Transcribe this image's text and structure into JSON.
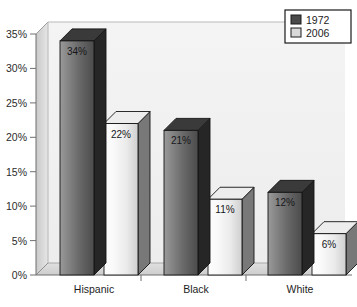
{
  "chart_data": {
    "type": "bar",
    "title": "",
    "subtitle": "",
    "xlabel": "",
    "ylabel": "",
    "categories": [
      "Hispanic",
      "Black",
      "White"
    ],
    "series": [
      {
        "name": "1972",
        "values": [
          34,
          21,
          12
        ],
        "color": "#4a4a4a"
      },
      {
        "name": "2006",
        "values": [
          22,
          11,
          6
        ],
        "color": "#e2e2e2"
      }
    ],
    "value_labels": [
      [
        "34%",
        "22%"
      ],
      [
        "21%",
        "11%"
      ],
      [
        "12%",
        "6%"
      ]
    ],
    "ylim": [
      0,
      35
    ],
    "ytick_values": [
      0,
      5,
      10,
      15,
      20,
      25,
      30,
      35
    ],
    "ytick_labels": [
      "0%",
      "5%",
      "10%",
      "15%",
      "20%",
      "25%",
      "30%",
      "35%"
    ],
    "grid": false,
    "legend_position": "top-right",
    "three_d": true
  },
  "legend": {
    "entries": [
      {
        "label": "1972",
        "swatch": "#4a4a4a"
      },
      {
        "label": "2006",
        "swatch": "#d9d9d9"
      }
    ]
  },
  "colors": {
    "bar_1972_face_light": "#8e8e8e",
    "bar_1972_face_dark": "#4d4d4d",
    "bar_1972_side": "#2a2a2a",
    "bar_1972_top": "#3a3a3a",
    "bar_2006_face_light": "#f6f6f6",
    "bar_2006_face_dark": "#d2d2d2",
    "bar_2006_side": "#6f6f6f",
    "bar_2006_top": "#e8e8e8",
    "wall": "#f2f2f2",
    "wall_side": "#d6d6d6",
    "floor": "#d8d8d8",
    "outline": "#1a1a1a",
    "axis": "#7a7a7a",
    "text": "#1d1d1d",
    "background": "#ffffff"
  }
}
